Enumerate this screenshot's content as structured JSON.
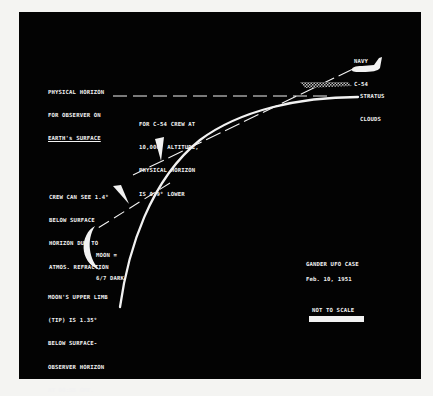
{
  "diagram": {
    "title": "GANDER UFO CASE",
    "date": "Feb. 10, 1951",
    "scale_note": "NOT TO SCALE",
    "colors": {
      "background": "#030303",
      "page": "#f4f4f2",
      "foreground": "#f2f2f2"
    },
    "labels": {
      "physical_horizon": [
        "PHYSICAL HORIZON",
        "FOR OBSERVER ON",
        "EARTH's SURFACE"
      ],
      "aircraft": [
        "NAVY",
        "C-54"
      ],
      "clouds": [
        "STRATUS",
        "CLOUDS"
      ],
      "crew_horizon": [
        "FOR C-54 CREW AT",
        "10,000' ALTITUDE,",
        "PHYSICAL HORIZON",
        "IS 0,9° LOWER"
      ],
      "refraction": [
        "CREW CAN SEE 1.4°",
        "BELOW SURFACE",
        "HORIZON DUE TO",
        "ATMOS. REFRACTION"
      ],
      "moon": [
        "MOON =",
        "6/7 DARK"
      ],
      "moon_limb": [
        "MOON'S UPPER LIMB",
        "(TIP) IS 1.35°",
        "BELOW SURFACE-",
        "OBSERVER HORIZON",
        "AT 00:55 GMT."
      ]
    },
    "elements": [
      {
        "name": "earth-surface-curve",
        "type": "curve"
      },
      {
        "name": "surface-horizon-line",
        "type": "dashed-line",
        "angle_deg": 0
      },
      {
        "name": "crew-physical-horizon-line",
        "type": "dashed-line",
        "offset_deg": 0.9
      },
      {
        "name": "refracted-horizon-line",
        "type": "dashed-line",
        "offset_deg": 1.4
      },
      {
        "name": "navy-c54-aircraft",
        "type": "silhouette"
      },
      {
        "name": "stratus-cloud-layer",
        "type": "hatched-band"
      },
      {
        "name": "crescent-moon",
        "type": "crescent",
        "dark_fraction": "6/7"
      }
    ]
  }
}
